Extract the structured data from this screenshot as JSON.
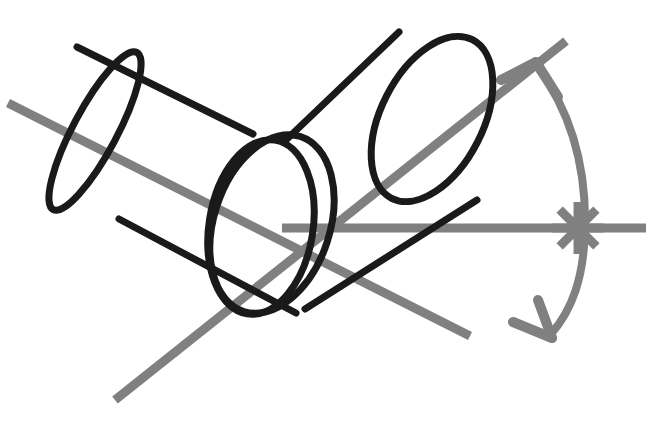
{
  "figure": {
    "background_color": "#ffffff",
    "width": 650,
    "height": 421,
    "colors": {
      "outline": "#1a1a1a",
      "axis": "#808080",
      "arc": "#808080",
      "marker": "#808080"
    },
    "stroke_widths": {
      "outline": 7,
      "axis": 9,
      "arc": 8,
      "marker": 9
    }
  },
  "shapes": {
    "left_cylinder": {
      "label": "left-cylinder",
      "far_ellipse": {
        "cx": 95,
        "cy": 131,
        "rx": 22,
        "ry": 89,
        "rotation_deg": 28
      },
      "near_ellipse": {
        "cx": 272,
        "cy": 224,
        "rx": 58,
        "ry": 92,
        "rotation_deg": 18
      },
      "body_top_path": "M 77 47 L 253 134",
      "body_bottom_path": "M 119 219 L 296 313"
    },
    "right_cylinder": {
      "label": "right-cylinder",
      "rear_ellipse": {
        "cx": 261,
        "cy": 227,
        "rx": 52,
        "ry": 88,
        "rotation_deg": 9
      },
      "front_ellipse": {
        "cx": 432,
        "cy": 119,
        "rx": 51,
        "ry": 89,
        "rotation_deg": 27
      },
      "body_top_path": "M 286 140 L 399 32",
      "body_bottom_path": "M 305 309 L 477 200"
    },
    "axes": [
      {
        "name": "left-cylinder-axis",
        "x1": 8,
        "y1": 103,
        "x2": 470,
        "y2": 336,
        "color": "#808080",
        "width": 9
      },
      {
        "name": "right-cylinder-axis",
        "x1": 115,
        "y1": 400,
        "x2": 566,
        "y2": 41,
        "color": "#808080",
        "width": 9
      },
      {
        "name": "horizontal-reference-axis",
        "x1": 282,
        "y1": 228,
        "x2": 646,
        "y2": 228,
        "color": "#808080",
        "width": 9
      }
    ],
    "angle_arc": {
      "name": "angle-arc",
      "path": "M 537 66 C 577 120 586 180 585 228 C 584 278 572 310 551 334",
      "color": "#808080",
      "width": 8
    },
    "arrow_heads": [
      {
        "name": "arc-arrowhead-top",
        "tip_x": 536,
        "tip_y": 62,
        "barb1": "M 536 62 L 501 80",
        "barb2": "M 536 62 L 558 97"
      },
      {
        "name": "arc-arrowhead-bottom",
        "tip_x": 552,
        "tip_y": 338,
        "barb1": "M 552 338 L 513 322",
        "barb2": "M 552 338 L 538 300"
      }
    ],
    "star_marker": {
      "name": "angle-vertex-star",
      "cx": 578,
      "cy": 228,
      "radius": 26,
      "spoke_count": 4,
      "color": "#808080",
      "width": 9
    }
  }
}
